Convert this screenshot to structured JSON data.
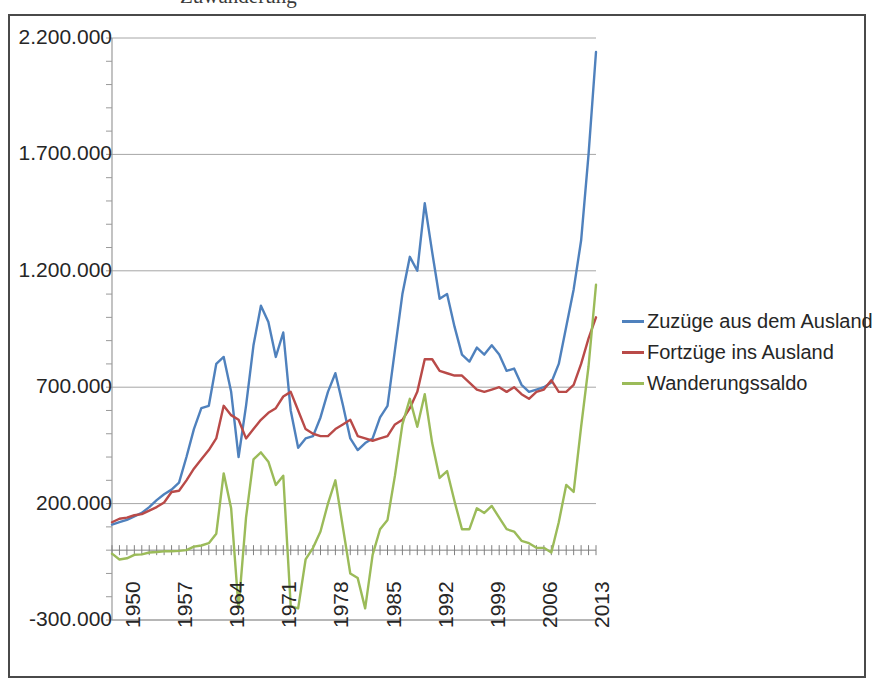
{
  "title_partial": "Zuwanderung",
  "axis": {
    "y_ticks": [
      "2.200.000",
      "1.700.000",
      "1.200.000",
      "700.000",
      "200.000",
      "-300.000"
    ],
    "x_ticks": [
      "1950",
      "1957",
      "1964",
      "1971",
      "1978",
      "1985",
      "1992",
      "1999",
      "2006",
      "2013"
    ]
  },
  "legend": {
    "items": [
      {
        "label": "Zuzüge aus dem Ausland",
        "color": "#4F81BD"
      },
      {
        "label": "Fortzüge ins Ausland",
        "color": "#B94A48"
      },
      {
        "label": "Wanderungssaldo",
        "color": "#9BBB59"
      }
    ]
  },
  "colors": {
    "zuzuege": "#4F81BD",
    "fortzuege": "#B94A48",
    "saldo": "#9BBB59",
    "gridline": "#A6A6A6",
    "axis": "#9a9a9a",
    "frame": "#4a4a4a",
    "text": "#262626",
    "background": "#FFFFFF"
  },
  "chart_data": {
    "type": "line",
    "title": "Zuwanderung",
    "xlabel": "",
    "ylabel": "",
    "ylim": [
      -300000,
      2200000
    ],
    "ytick_step": 500000,
    "yminor_step": 100000,
    "grid": true,
    "legend_position": "right",
    "x": [
      1950,
      1951,
      1952,
      1953,
      1954,
      1955,
      1956,
      1957,
      1958,
      1959,
      1960,
      1961,
      1962,
      1963,
      1964,
      1965,
      1966,
      1967,
      1968,
      1969,
      1970,
      1971,
      1972,
      1973,
      1974,
      1975,
      1976,
      1977,
      1978,
      1979,
      1980,
      1981,
      1982,
      1983,
      1984,
      1985,
      1986,
      1987,
      1988,
      1989,
      1990,
      1991,
      1992,
      1993,
      1994,
      1995,
      1996,
      1997,
      1998,
      1999,
      2000,
      2001,
      2002,
      2003,
      2004,
      2005,
      2006,
      2007,
      2008,
      2009,
      2010,
      2011,
      2012,
      2013,
      2014,
      2015
    ],
    "series": [
      {
        "name": "Zuzüge aus dem Ausland",
        "color": "#4F81BD",
        "values": [
          110000,
          120000,
          130000,
          145000,
          160000,
          185000,
          215000,
          240000,
          260000,
          290000,
          400000,
          520000,
          610000,
          620000,
          800000,
          830000,
          680000,
          400000,
          620000,
          880000,
          1050000,
          980000,
          830000,
          935000,
          600000,
          440000,
          480000,
          490000,
          570000,
          680000,
          760000,
          625000,
          480000,
          430000,
          460000,
          480000,
          570000,
          620000,
          860000,
          1100000,
          1260000,
          1200000,
          1490000,
          1280000,
          1080000,
          1100000,
          960000,
          840000,
          810000,
          870000,
          840000,
          880000,
          840000,
          770000,
          780000,
          710000,
          680000,
          690000,
          700000,
          720000,
          800000,
          960000,
          1120000,
          1330000,
          1700000,
          2140000
        ]
      },
      {
        "name": "Fortzüge ins Ausland",
        "color": "#B94A48",
        "values": [
          120000,
          135000,
          140000,
          150000,
          155000,
          170000,
          185000,
          205000,
          250000,
          255000,
          300000,
          350000,
          390000,
          430000,
          480000,
          620000,
          580000,
          560000,
          480000,
          520000,
          560000,
          590000,
          610000,
          660000,
          680000,
          600000,
          520000,
          500000,
          490000,
          490000,
          520000,
          540000,
          560000,
          490000,
          480000,
          470000,
          480000,
          490000,
          540000,
          560000,
          610000,
          680000,
          820000,
          820000,
          770000,
          760000,
          750000,
          750000,
          720000,
          690000,
          680000,
          690000,
          700000,
          680000,
          700000,
          670000,
          650000,
          680000,
          690000,
          730000,
          680000,
          680000,
          710000,
          800000,
          910000,
          1000000
        ]
      },
      {
        "name": "Wanderungssaldo",
        "color": "#9BBB59",
        "values": [
          -15000,
          -40000,
          -35000,
          -20000,
          -18000,
          -10000,
          -8000,
          -5000,
          -5000,
          -3000,
          0,
          15000,
          20000,
          30000,
          70000,
          330000,
          180000,
          -250000,
          140000,
          390000,
          420000,
          380000,
          280000,
          320000,
          -240000,
          -250000,
          -40000,
          10000,
          80000,
          200000,
          300000,
          100000,
          -100000,
          -120000,
          -250000,
          -20000,
          90000,
          130000,
          320000,
          540000,
          650000,
          530000,
          670000,
          460000,
          310000,
          340000,
          210000,
          90000,
          90000,
          180000,
          160000,
          190000,
          140000,
          90000,
          80000,
          40000,
          30000,
          10000,
          10000,
          -10000,
          120000,
          280000,
          250000,
          530000,
          790000,
          1140000
        ]
      }
    ]
  }
}
